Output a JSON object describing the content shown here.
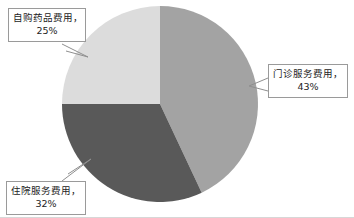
{
  "chart_data": {
    "type": "pie",
    "title": "",
    "subtitle": "",
    "xlabel": "",
    "ylabel": "",
    "legend_position": "none",
    "grid": false,
    "labels_shown_as": "callout-boxes",
    "start_angle_deg": 0,
    "direction": "clockwise",
    "categories": [
      "门诊服务费用",
      "住院服务费用",
      "自购药品费用"
    ],
    "values": [
      43,
      32,
      25
    ],
    "unit": "%",
    "slices": [
      {
        "id": "outpatient",
        "name": "门诊服务费用",
        "label_line1": "门诊服务费用，",
        "label_line2": "43%",
        "value": 43,
        "color": "#a3a3a3",
        "start_deg": 0,
        "end_deg": 154.8
      },
      {
        "id": "inpatient",
        "name": "住院服务费用",
        "label_line1": "住院服务费用，",
        "label_line2": "32%",
        "value": 32,
        "color": "#595959",
        "start_deg": 154.8,
        "end_deg": 270
      },
      {
        "id": "self_purchase",
        "name": "自购药品费用",
        "label_line1": "自购药品费用，",
        "label_line2": "25%",
        "value": 25,
        "color": "#dcdcdc",
        "start_deg": 270,
        "end_deg": 360
      }
    ]
  },
  "colors": {
    "outpatient": "#a3a3a3",
    "inpatient": "#595959",
    "self_purchase": "#dcdcdc",
    "callout_border": "#9a9a9a",
    "callout_background": "#ffffff",
    "text": "#1c1c1c",
    "frame_line": "#d7d7d7",
    "page_background": "#ffffff"
  }
}
